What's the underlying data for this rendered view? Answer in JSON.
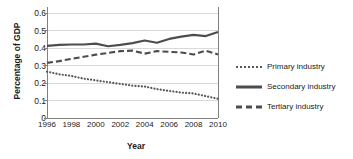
{
  "chart_data": {
    "type": "line",
    "title": "",
    "xlabel": "Year",
    "ylabel": "Percentage of GDP",
    "x": [
      1996,
      1997,
      1998,
      1999,
      2000,
      2001,
      2002,
      2003,
      2004,
      2005,
      2006,
      2007,
      2008,
      2009,
      2010
    ],
    "xtick_labels": [
      "1996",
      "1998",
      "2000",
      "2002",
      "2004",
      "2006",
      "2008",
      "2010"
    ],
    "xtick_values": [
      1996,
      1998,
      2000,
      2002,
      2004,
      2006,
      2008,
      2010
    ],
    "ytick_labels": [
      "0",
      "0.1",
      "0.2",
      "0.3",
      "0.4",
      "0.5",
      "0.6"
    ],
    "ytick_values": [
      0,
      0.1,
      0.2,
      0.3,
      0.4,
      0.5,
      0.6
    ],
    "xlim": [
      1996,
      2010
    ],
    "ylim": [
      0,
      0.6
    ],
    "grid": "horizontal",
    "legend_position": "right",
    "series": [
      {
        "name": "Primary industry",
        "style": "dotted",
        "color": "#595959",
        "values": [
          0.265,
          0.25,
          0.24,
          0.225,
          0.215,
          0.205,
          0.195,
          0.185,
          0.18,
          0.165,
          0.155,
          0.145,
          0.14,
          0.125,
          0.11
        ]
      },
      {
        "name": "Secondary industry",
        "style": "solid",
        "color": "#4d4d4d",
        "values": [
          0.412,
          0.418,
          0.42,
          0.42,
          0.425,
          0.41,
          0.418,
          0.428,
          0.443,
          0.43,
          0.452,
          0.465,
          0.475,
          0.468,
          0.492
        ]
      },
      {
        "name": "Tertiary industry",
        "style": "dashed",
        "color": "#4d4d4d",
        "values": [
          0.315,
          0.325,
          0.338,
          0.35,
          0.362,
          0.372,
          0.382,
          0.385,
          0.368,
          0.382,
          0.378,
          0.374,
          0.363,
          0.385,
          0.363
        ]
      }
    ]
  },
  "legend": {
    "items": [
      {
        "label": "Primary industry",
        "style": "dotted"
      },
      {
        "label": "Secondary industry",
        "style": "solid"
      },
      {
        "label": "Tertiary industry",
        "style": "dashed"
      }
    ]
  },
  "colors": {
    "axis": "#808080",
    "grid": "#d9d9d9",
    "text": "#1a1a1a",
    "line_dark": "#4d4d4d",
    "line_dotted": "#595959"
  }
}
